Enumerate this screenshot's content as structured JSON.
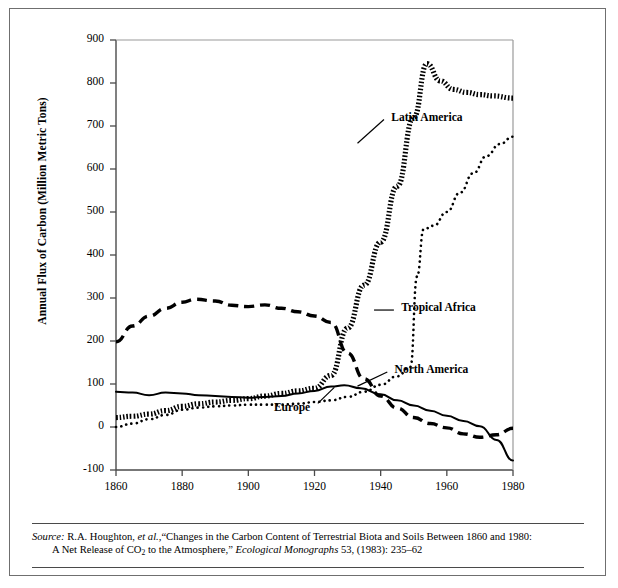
{
  "chart_data": {
    "type": "line",
    "title": "",
    "xlabel": "",
    "ylabel": "Annual Flux of Carbon (Million Metric Tons)",
    "xlim": [
      1860,
      1980
    ],
    "ylim": [
      -100,
      900
    ],
    "xticks": [
      1860,
      1880,
      1900,
      1920,
      1940,
      1960,
      1980
    ],
    "yticks": [
      -100,
      0,
      100,
      200,
      300,
      400,
      500,
      600,
      700,
      800,
      900
    ],
    "grid": false,
    "legend_position": "inline-annotations",
    "series": [
      {
        "name": "Latin America",
        "style": "thick-dotted",
        "label_x": 1942,
        "label_y": 715,
        "x": [
          1860,
          1865,
          1870,
          1875,
          1880,
          1885,
          1890,
          1895,
          1900,
          1905,
          1910,
          1915,
          1920,
          1925,
          1930,
          1935,
          1940,
          1945,
          1950,
          1954,
          1958,
          1962,
          1966,
          1970,
          1974,
          1980
        ],
        "y": [
          22,
          25,
          30,
          38,
          48,
          54,
          58,
          62,
          66,
          72,
          78,
          84,
          90,
          120,
          230,
          330,
          430,
          560,
          720,
          845,
          805,
          785,
          778,
          773,
          770,
          765
        ]
      },
      {
        "name": "Tropical Africa",
        "style": "fine-dotted",
        "label_x": 1945,
        "label_y": 272,
        "x": [
          1860,
          1865,
          1870,
          1875,
          1880,
          1885,
          1890,
          1895,
          1900,
          1905,
          1910,
          1915,
          1920,
          1925,
          1930,
          1935,
          1940,
          1945,
          1949,
          1951,
          1953,
          1956,
          1960,
          1964,
          1968,
          1972,
          1976,
          1980
        ],
        "y": [
          0,
          8,
          18,
          28,
          40,
          45,
          48,
          50,
          52,
          52,
          52,
          54,
          58,
          62,
          70,
          82,
          98,
          118,
          140,
          350,
          460,
          468,
          500,
          545,
          590,
          630,
          658,
          675
        ]
      },
      {
        "name": "North America",
        "style": "dashed",
        "label_x": 1943,
        "label_y": 128,
        "x": [
          1860,
          1865,
          1870,
          1875,
          1880,
          1884,
          1890,
          1895,
          1900,
          1905,
          1910,
          1915,
          1920,
          1925,
          1930,
          1935,
          1940,
          1945,
          1950,
          1955,
          1960,
          1965,
          1970,
          1975,
          1980
        ],
        "y": [
          198,
          235,
          258,
          276,
          290,
          297,
          293,
          283,
          280,
          284,
          276,
          268,
          258,
          243,
          172,
          112,
          72,
          44,
          22,
          8,
          -2,
          -16,
          -24,
          -18,
          -3
        ]
      },
      {
        "name": "Europe",
        "style": "solid",
        "label_x": 1915,
        "label_y": 42,
        "x": [
          1860,
          1865,
          1870,
          1875,
          1880,
          1885,
          1890,
          1895,
          1900,
          1905,
          1910,
          1915,
          1920,
          1925,
          1929,
          1934,
          1940,
          1945,
          1950,
          1955,
          1960,
          1965,
          1970,
          1975,
          1980
        ],
        "y": [
          82,
          80,
          74,
          80,
          78,
          74,
          72,
          70,
          68,
          70,
          72,
          78,
          84,
          94,
          97,
          90,
          76,
          62,
          50,
          38,
          26,
          14,
          2,
          -30,
          -78
        ]
      }
    ]
  },
  "source": {
    "prefix": "Source:",
    "line1_a": " R.A. Houghton, ",
    "line1_italic": "et al.,",
    "line1_b": "“Changes in the Carbon Content of Terrestrial Biota and Soils Between 1860 and 1980:",
    "line2_a": "A Net Release of CO",
    "line2_sub": "2",
    "line2_b": " to the Atmosphere,” ",
    "line2_italic": "Ecological Monographs",
    "line2_c": " 53, (1983): 235–62"
  }
}
